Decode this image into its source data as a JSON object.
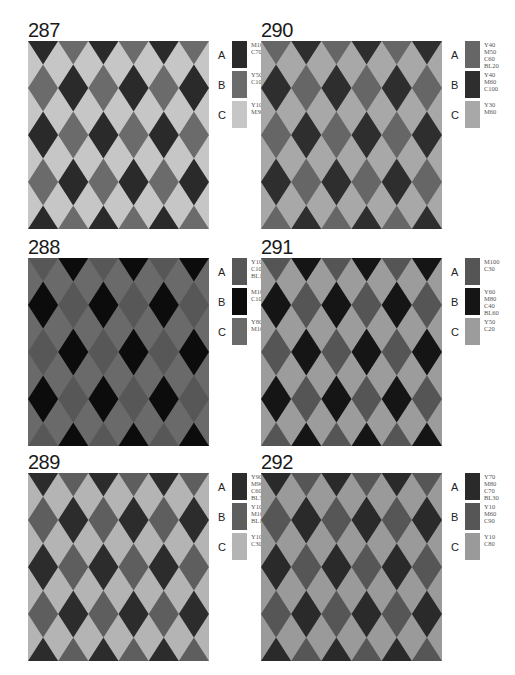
{
  "panels": [
    {
      "number": "287",
      "colors": {
        "A": "#2a2a2a",
        "B": "#6b6b6b",
        "C": "#c6c6c6"
      },
      "legend": [
        {
          "letter": "A",
          "label": "M100\nC70"
        },
        {
          "letter": "B",
          "label": "Y50\nC100"
        },
        {
          "letter": "C",
          "label": "Y100\nM30"
        }
      ]
    },
    {
      "number": "290",
      "colors": {
        "A": "#666666",
        "B": "#2e2e2e",
        "C": "#a8a8a8"
      },
      "legend": [
        {
          "letter": "A",
          "label": "Y40\nM50\nC60\nBL20"
        },
        {
          "letter": "B",
          "label": "Y40\nM60\nC100"
        },
        {
          "letter": "C",
          "label": "Y30\nM60"
        }
      ]
    },
    {
      "number": "288",
      "colors": {
        "A": "#575757",
        "B": "#0c0c0c",
        "C": "#6a6a6a"
      },
      "legend": [
        {
          "letter": "A",
          "label": "Y100\nC100\nBL10"
        },
        {
          "letter": "B",
          "label": "M100\nC100"
        },
        {
          "letter": "C",
          "label": "Y80\nM100"
        }
      ]
    },
    {
      "number": "291",
      "colors": {
        "A": "#555555",
        "B": "#151515",
        "C": "#9c9c9c"
      },
      "legend": [
        {
          "letter": "A",
          "label": "M100\nC30"
        },
        {
          "letter": "B",
          "label": "Y60\nM80\nC40\nBL60"
        },
        {
          "letter": "C",
          "label": "Y50\nC20"
        }
      ]
    },
    {
      "number": "289",
      "colors": {
        "A": "#2c2c2c",
        "B": "#5e5e5e",
        "C": "#b4b4b4"
      },
      "legend": [
        {
          "letter": "A",
          "label": "Y90\nM90\nC60\nBL30"
        },
        {
          "letter": "B",
          "label": "Y100\nM100\nBL10"
        },
        {
          "letter": "C",
          "label": "Y100\nC30"
        }
      ]
    },
    {
      "number": "292",
      "colors": {
        "A": "#2a2a2a",
        "B": "#565656",
        "C": "#9a9a9a"
      },
      "legend": [
        {
          "letter": "A",
          "label": "Y70\nM80\nC70\nBL30"
        },
        {
          "letter": "B",
          "label": "Y10\nM60\nC90"
        },
        {
          "letter": "C",
          "label": "Y10\nC80"
        }
      ]
    }
  ],
  "layout": {
    "positions": [
      [
        28,
        20
      ],
      [
        261,
        20
      ],
      [
        28,
        237
      ],
      [
        261,
        237
      ],
      [
        28,
        452
      ],
      [
        261,
        452
      ]
    ]
  }
}
